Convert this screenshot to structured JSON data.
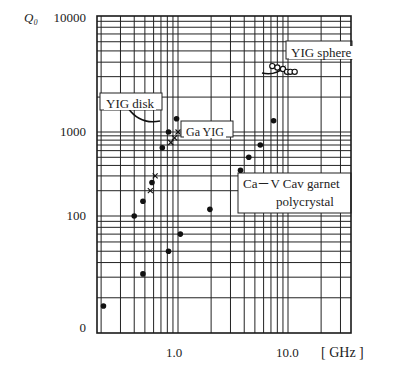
{
  "chart_data": {
    "type": "scatter",
    "title": "",
    "ylabel": "Q0",
    "xlabel": "[ GHz ]",
    "x_scale": "log",
    "y_scale": "log",
    "xlim": [
      0.18,
      46
    ],
    "ylim": [
      10,
      10000
    ],
    "grid": true,
    "y_tick_labels": [
      "10000",
      "1000",
      "100",
      "0"
    ],
    "x_tick_labels": [
      "1.0",
      "10.0"
    ],
    "annotations": [
      {
        "text": "YIG disk",
        "x_px": 101,
        "y_px": 96
      },
      {
        "text": "Ga YIG",
        "x_px": 187,
        "y_px": 127
      },
      {
        "text": "YIG sphere",
        "x_px": 290,
        "y_px": 47
      },
      {
        "text": "Ca－V Cav garnet",
        "x_px": 244,
        "y_px": 178
      },
      {
        "text": "polycrystal",
        "x_px": 276,
        "y_px": 196
      }
    ],
    "series": [
      {
        "name": "YIG disk",
        "marker": "filled-circle",
        "points": [
          {
            "x": 0.4,
            "y": 100
          },
          {
            "x": 0.48,
            "y": 150
          },
          {
            "x": 0.58,
            "y": 250
          },
          {
            "x": 0.72,
            "y": 650
          },
          {
            "x": 0.82,
            "y": 1000
          },
          {
            "x": 0.97,
            "y": 1300
          }
        ]
      },
      {
        "name": "Ga YIG",
        "marker": "x",
        "points": [
          {
            "x": 0.56,
            "y": 200
          },
          {
            "x": 0.62,
            "y": 300
          },
          {
            "x": 0.86,
            "y": 750
          },
          {
            "x": 0.93,
            "y": 850
          },
          {
            "x": 1.0,
            "y": 1000
          }
        ]
      },
      {
        "name": "YIG sphere",
        "marker": "open-circle",
        "points": [
          {
            "x": 7.2,
            "y": 3700
          },
          {
            "x": 8.0,
            "y": 3600
          },
          {
            "x": 9.0,
            "y": 3500
          },
          {
            "x": 9.8,
            "y": 3300
          },
          {
            "x": 10.5,
            "y": 3300
          },
          {
            "x": 11.5,
            "y": 3300
          }
        ]
      },
      {
        "name": "Ca-V Cav garnet polycrystal",
        "marker": "filled-circle",
        "points": [
          {
            "x": 0.21,
            "y": 17
          },
          {
            "x": 0.48,
            "y": 32
          },
          {
            "x": 0.82,
            "y": 50
          },
          {
            "x": 1.05,
            "y": 70
          },
          {
            "x": 1.95,
            "y": 120
          },
          {
            "x": 3.7,
            "y": 350
          },
          {
            "x": 4.4,
            "y": 500
          },
          {
            "x": 5.6,
            "y": 700
          },
          {
            "x": 7.4,
            "y": 1250
          }
        ]
      }
    ]
  },
  "axis": {
    "y_title": "Q₀",
    "x_unit": "[ GHz ]",
    "y_ticks": [
      {
        "label": "10000",
        "y": 18
      },
      {
        "label": "1000",
        "y": 132
      },
      {
        "label": "100",
        "y": 216
      },
      {
        "label": "0",
        "y": 328
      }
    ],
    "x_ticks": [
      {
        "label": "1.0",
        "x": 178
      },
      {
        "label": "10.0",
        "x": 288
      }
    ]
  },
  "labels": {
    "yig_disk": "YIG disk",
    "ga_yig": "Ga YIG",
    "yig_sphere": "YIG sphere",
    "cav_line1": "Ca－V Cav garnet",
    "cav_line2": "polycrystal"
  }
}
